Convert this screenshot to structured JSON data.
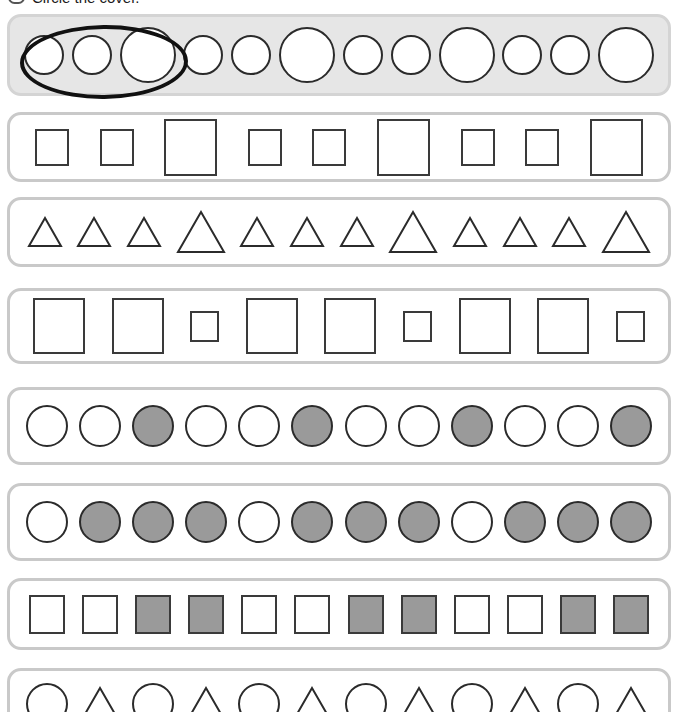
{
  "instruction": {
    "text": "Circle the cover.",
    "badge_icon": "rounded-rect-icon"
  },
  "colors": {
    "shape_outline": "#2b2b2b",
    "shape_fill_gray": "#9a9a9a",
    "shape_fill_white": "#ffffff",
    "row_border": "#c9c9c9",
    "row_shaded_background": "#e6e6e6",
    "answer_mark": "#111111",
    "page_background": "#ffffff"
  },
  "rows": [
    {
      "index": 1,
      "shaded": true,
      "has_answer_mark": true,
      "answer_mark_covers": 3,
      "pattern_description": "small, small, large",
      "top": 14,
      "height": 82,
      "shapes": [
        {
          "type": "circle",
          "size": "small",
          "fill": "white",
          "w": 40
        },
        {
          "type": "circle",
          "size": "small",
          "fill": "white",
          "w": 40
        },
        {
          "type": "circle",
          "size": "large",
          "fill": "white",
          "w": 56
        },
        {
          "type": "circle",
          "size": "small",
          "fill": "white",
          "w": 40
        },
        {
          "type": "circle",
          "size": "small",
          "fill": "white",
          "w": 40
        },
        {
          "type": "circle",
          "size": "large",
          "fill": "white",
          "w": 56
        },
        {
          "type": "circle",
          "size": "small",
          "fill": "white",
          "w": 40
        },
        {
          "type": "circle",
          "size": "small",
          "fill": "white",
          "w": 40
        },
        {
          "type": "circle",
          "size": "large",
          "fill": "white",
          "w": 56
        },
        {
          "type": "circle",
          "size": "small",
          "fill": "white",
          "w": 40
        },
        {
          "type": "circle",
          "size": "small",
          "fill": "white",
          "w": 40
        },
        {
          "type": "circle",
          "size": "large",
          "fill": "white",
          "w": 56
        }
      ]
    },
    {
      "index": 2,
      "shaded": false,
      "has_answer_mark": false,
      "pattern_description": "small, small, large",
      "top": 112,
      "height": 70,
      "shapes": [
        {
          "type": "square",
          "size": "small",
          "fill": "white",
          "w": 34
        },
        {
          "type": "square",
          "size": "small",
          "fill": "white",
          "w": 34
        },
        {
          "type": "square",
          "size": "large",
          "fill": "white",
          "w": 53
        },
        {
          "type": "square",
          "size": "small",
          "fill": "white",
          "w": 34
        },
        {
          "type": "square",
          "size": "small",
          "fill": "white",
          "w": 34
        },
        {
          "type": "square",
          "size": "large",
          "fill": "white",
          "w": 53
        },
        {
          "type": "square",
          "size": "small",
          "fill": "white",
          "w": 34
        },
        {
          "type": "square",
          "size": "small",
          "fill": "white",
          "w": 34
        },
        {
          "type": "square",
          "size": "large",
          "fill": "white",
          "w": 53
        }
      ]
    },
    {
      "index": 3,
      "shaded": false,
      "has_answer_mark": false,
      "pattern_description": "small, small, small, large",
      "top": 197,
      "height": 70,
      "shapes": [
        {
          "type": "triangle",
          "size": "small",
          "fill": "white",
          "w": 36
        },
        {
          "type": "triangle",
          "size": "small",
          "fill": "white",
          "w": 36
        },
        {
          "type": "triangle",
          "size": "small",
          "fill": "white",
          "w": 36
        },
        {
          "type": "triangle",
          "size": "large",
          "fill": "white",
          "w": 50
        },
        {
          "type": "triangle",
          "size": "small",
          "fill": "white",
          "w": 36
        },
        {
          "type": "triangle",
          "size": "small",
          "fill": "white",
          "w": 36
        },
        {
          "type": "triangle",
          "size": "small",
          "fill": "white",
          "w": 36
        },
        {
          "type": "triangle",
          "size": "large",
          "fill": "white",
          "w": 50
        },
        {
          "type": "triangle",
          "size": "small",
          "fill": "white",
          "w": 36
        },
        {
          "type": "triangle",
          "size": "small",
          "fill": "white",
          "w": 36
        },
        {
          "type": "triangle",
          "size": "small",
          "fill": "white",
          "w": 36
        },
        {
          "type": "triangle",
          "size": "large",
          "fill": "white",
          "w": 50
        }
      ]
    },
    {
      "index": 4,
      "shaded": false,
      "has_answer_mark": false,
      "pattern_description": "large, large, small",
      "top": 288,
      "height": 76,
      "shapes": [
        {
          "type": "square",
          "size": "large",
          "fill": "white",
          "w": 52
        },
        {
          "type": "square",
          "size": "large",
          "fill": "white",
          "w": 52
        },
        {
          "type": "square",
          "size": "small",
          "fill": "white",
          "w": 29
        },
        {
          "type": "square",
          "size": "large",
          "fill": "white",
          "w": 52
        },
        {
          "type": "square",
          "size": "large",
          "fill": "white",
          "w": 52
        },
        {
          "type": "square",
          "size": "small",
          "fill": "white",
          "w": 29
        },
        {
          "type": "square",
          "size": "large",
          "fill": "white",
          "w": 52
        },
        {
          "type": "square",
          "size": "large",
          "fill": "white",
          "w": 52
        },
        {
          "type": "square",
          "size": "small",
          "fill": "white",
          "w": 29
        }
      ]
    },
    {
      "index": 5,
      "shaded": false,
      "has_answer_mark": false,
      "pattern_description": "white, white, gray",
      "top": 387,
      "height": 78,
      "shapes": [
        {
          "type": "circle",
          "size": "medium",
          "fill": "white",
          "w": 42
        },
        {
          "type": "circle",
          "size": "medium",
          "fill": "white",
          "w": 42
        },
        {
          "type": "circle",
          "size": "medium",
          "fill": "gray",
          "w": 42
        },
        {
          "type": "circle",
          "size": "medium",
          "fill": "white",
          "w": 42
        },
        {
          "type": "circle",
          "size": "medium",
          "fill": "white",
          "w": 42
        },
        {
          "type": "circle",
          "size": "medium",
          "fill": "gray",
          "w": 42
        },
        {
          "type": "circle",
          "size": "medium",
          "fill": "white",
          "w": 42
        },
        {
          "type": "circle",
          "size": "medium",
          "fill": "white",
          "w": 42
        },
        {
          "type": "circle",
          "size": "medium",
          "fill": "gray",
          "w": 42
        },
        {
          "type": "circle",
          "size": "medium",
          "fill": "white",
          "w": 42
        },
        {
          "type": "circle",
          "size": "medium",
          "fill": "white",
          "w": 42
        },
        {
          "type": "circle",
          "size": "medium",
          "fill": "gray",
          "w": 42
        }
      ]
    },
    {
      "index": 6,
      "shaded": false,
      "has_answer_mark": false,
      "pattern_description": "white, gray, gray, gray",
      "top": 483,
      "height": 78,
      "shapes": [
        {
          "type": "circle",
          "size": "medium",
          "fill": "white",
          "w": 42
        },
        {
          "type": "circle",
          "size": "medium",
          "fill": "gray",
          "w": 42
        },
        {
          "type": "circle",
          "size": "medium",
          "fill": "gray",
          "w": 42
        },
        {
          "type": "circle",
          "size": "medium",
          "fill": "gray",
          "w": 42
        },
        {
          "type": "circle",
          "size": "medium",
          "fill": "white",
          "w": 42
        },
        {
          "type": "circle",
          "size": "medium",
          "fill": "gray",
          "w": 42
        },
        {
          "type": "circle",
          "size": "medium",
          "fill": "gray",
          "w": 42
        },
        {
          "type": "circle",
          "size": "medium",
          "fill": "gray",
          "w": 42
        },
        {
          "type": "circle",
          "size": "medium",
          "fill": "white",
          "w": 42
        },
        {
          "type": "circle",
          "size": "medium",
          "fill": "gray",
          "w": 42
        },
        {
          "type": "circle",
          "size": "medium",
          "fill": "gray",
          "w": 42
        },
        {
          "type": "circle",
          "size": "medium",
          "fill": "gray",
          "w": 42
        }
      ]
    },
    {
      "index": 7,
      "shaded": false,
      "has_answer_mark": false,
      "pattern_description": "white, white, gray, gray",
      "top": 578,
      "height": 72,
      "shapes": [
        {
          "type": "square",
          "size": "medium",
          "fill": "white",
          "w": 36
        },
        {
          "type": "square",
          "size": "medium",
          "fill": "white",
          "w": 36
        },
        {
          "type": "square",
          "size": "medium",
          "fill": "gray",
          "w": 36
        },
        {
          "type": "square",
          "size": "medium",
          "fill": "gray",
          "w": 36
        },
        {
          "type": "square",
          "size": "medium",
          "fill": "white",
          "w": 36
        },
        {
          "type": "square",
          "size": "medium",
          "fill": "white",
          "w": 36
        },
        {
          "type": "square",
          "size": "medium",
          "fill": "gray",
          "w": 36
        },
        {
          "type": "square",
          "size": "medium",
          "fill": "gray",
          "w": 36
        },
        {
          "type": "square",
          "size": "medium",
          "fill": "white",
          "w": 36
        },
        {
          "type": "square",
          "size": "medium",
          "fill": "white",
          "w": 36
        },
        {
          "type": "square",
          "size": "medium",
          "fill": "gray",
          "w": 36
        },
        {
          "type": "square",
          "size": "medium",
          "fill": "gray",
          "w": 36
        }
      ]
    },
    {
      "index": 8,
      "shaded": false,
      "has_answer_mark": false,
      "clipped_by_page_edge": true,
      "pattern_description": "circle, triangle",
      "top": 668,
      "height": 72,
      "shapes": [
        {
          "type": "circle",
          "size": "medium",
          "fill": "white",
          "w": 42
        },
        {
          "type": "triangle",
          "size": "medium",
          "fill": "white",
          "w": 42
        },
        {
          "type": "circle",
          "size": "medium",
          "fill": "white",
          "w": 42
        },
        {
          "type": "triangle",
          "size": "medium",
          "fill": "white",
          "w": 42
        },
        {
          "type": "circle",
          "size": "medium",
          "fill": "white",
          "w": 42
        },
        {
          "type": "triangle",
          "size": "medium",
          "fill": "white",
          "w": 42
        },
        {
          "type": "circle",
          "size": "medium",
          "fill": "white",
          "w": 42
        },
        {
          "type": "triangle",
          "size": "medium",
          "fill": "white",
          "w": 42
        },
        {
          "type": "circle",
          "size": "medium",
          "fill": "white",
          "w": 42
        },
        {
          "type": "triangle",
          "size": "medium",
          "fill": "white",
          "w": 42
        },
        {
          "type": "circle",
          "size": "medium",
          "fill": "white",
          "w": 42
        },
        {
          "type": "triangle",
          "size": "medium",
          "fill": "white",
          "w": 42
        }
      ]
    }
  ]
}
